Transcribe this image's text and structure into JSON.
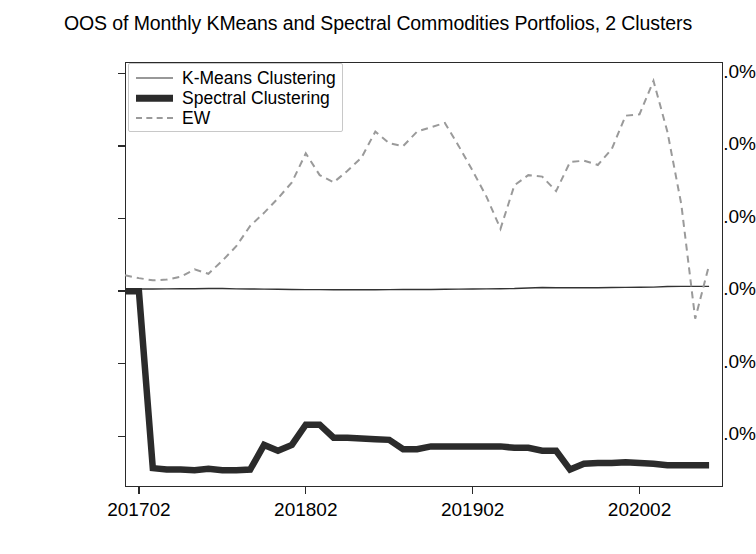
{
  "chart_data": {
    "type": "line",
    "title": "OOS of Monthly KMeans and Spectral Commodities Portfolios, 2 Clusters",
    "xlabel": "",
    "ylabel": "",
    "grid": false,
    "legend_position": "upper left",
    "xlim": [
      0,
      43
    ],
    "ylim": [
      -13.5,
      15.8
    ],
    "yticks": [
      15.0,
      10.0,
      5.0,
      0.0,
      -5.0,
      -10.0
    ],
    "ytick_labels": [
      "15.0%",
      "10.0%",
      "5.0%",
      "0.0%",
      "−5.0%",
      "−10.0%"
    ],
    "xticks": [
      1,
      13,
      25,
      37
    ],
    "xtick_labels": [
      "201702",
      "201802",
      "201902",
      "202002"
    ],
    "x": [
      0,
      1,
      2,
      3,
      4,
      5,
      6,
      7,
      8,
      9,
      10,
      11,
      12,
      13,
      14,
      15,
      16,
      17,
      18,
      19,
      20,
      21,
      22,
      23,
      24,
      25,
      26,
      27,
      28,
      29,
      30,
      31,
      32,
      33,
      34,
      35,
      36,
      37,
      38,
      39,
      40,
      41,
      42
    ],
    "series": [
      {
        "name": "K-Means Clustering",
        "style": "solid-thin",
        "color": "#333333",
        "linewidth": 1.4,
        "values": [
          0.0,
          0.15,
          0.15,
          0.16,
          0.17,
          0.17,
          0.18,
          0.18,
          0.16,
          0.15,
          0.14,
          0.13,
          0.12,
          0.11,
          0.11,
          0.1,
          0.1,
          0.1,
          0.1,
          0.11,
          0.12,
          0.12,
          0.12,
          0.13,
          0.14,
          0.15,
          0.16,
          0.17,
          0.18,
          0.22,
          0.25,
          0.24,
          0.24,
          0.24,
          0.24,
          0.25,
          0.26,
          0.27,
          0.28,
          0.32,
          0.33,
          0.33,
          0.33
        ]
      },
      {
        "name": "Spectral Clustering",
        "style": "solid-thick",
        "color": "#2b2b2b",
        "linewidth": 6.5,
        "values": [
          0.0,
          0.0,
          -12.2,
          -12.3,
          -12.3,
          -12.35,
          -12.25,
          -12.35,
          -12.35,
          -12.3,
          -10.6,
          -11.0,
          -10.6,
          -9.2,
          -9.2,
          -10.1,
          -10.1,
          -10.15,
          -10.2,
          -10.25,
          -10.9,
          -10.9,
          -10.7,
          -10.7,
          -10.7,
          -10.7,
          -10.7,
          -10.7,
          -10.8,
          -10.8,
          -11.0,
          -11.0,
          -12.3,
          -11.9,
          -11.85,
          -11.85,
          -11.8,
          -11.85,
          -11.9,
          -12.0,
          -12.0,
          -12.0,
          -12.0
        ]
      },
      {
        "name": "EW",
        "style": "dashed",
        "color": "#9a9a9a",
        "linewidth": 2.0,
        "values": [
          1.1,
          0.9,
          0.75,
          0.8,
          1.0,
          1.5,
          1.2,
          2.1,
          3.1,
          4.5,
          5.4,
          6.4,
          7.5,
          9.5,
          8.0,
          7.5,
          8.3,
          9.2,
          11.0,
          10.2,
          10.0,
          11.0,
          11.3,
          11.6,
          10.0,
          8.3,
          6.5,
          4.3,
          7.3,
          8.0,
          7.9,
          6.9,
          8.9,
          9.0,
          8.7,
          9.8,
          12.1,
          12.2,
          14.5,
          11.0,
          6.0,
          -1.9,
          1.8
        ]
      }
    ]
  },
  "legend": {
    "items": [
      {
        "label": "K-Means Clustering",
        "swatch": "thin-line-swatch"
      },
      {
        "label": "Spectral Clustering",
        "swatch": "thick-line-swatch"
      },
      {
        "label": "EW",
        "swatch": "dashed-line-swatch"
      }
    ]
  }
}
